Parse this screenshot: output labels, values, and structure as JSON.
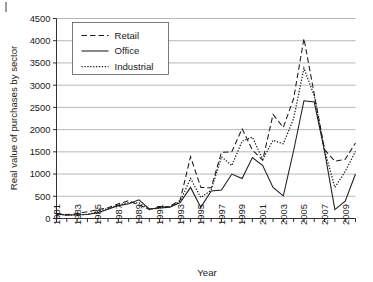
{
  "chart_data": {
    "type": "line",
    "title": "",
    "xlabel": "Year",
    "ylabel": "Real value of purchases by sector",
    "ylim": [
      0,
      4500
    ],
    "xlim": [
      1981,
      2010
    ],
    "grid": true,
    "legend_position": "top-left",
    "yticks": [
      0,
      500,
      1000,
      1500,
      2000,
      2500,
      3000,
      3500,
      4000,
      4500
    ],
    "ytick_labels": [
      "0",
      "500",
      "1000",
      "1500",
      "2000",
      "2500",
      "3000",
      "3500",
      "4000",
      "4500"
    ],
    "x": [
      1981,
      1982,
      1983,
      1984,
      1985,
      1986,
      1987,
      1988,
      1989,
      1990,
      1991,
      1992,
      1993,
      1994,
      1995,
      1996,
      1997,
      1998,
      1999,
      2000,
      2001,
      2002,
      2003,
      2004,
      2005,
      2006,
      2007,
      2008,
      2009,
      2010
    ],
    "xtick_labels": [
      "1981",
      "",
      "1983",
      "",
      "1985",
      "",
      "1987",
      "",
      "1989",
      "",
      "1991",
      "",
      "1993",
      "",
      "1995",
      "",
      "1997",
      "",
      "1999",
      "",
      "2001",
      "",
      "2003",
      "",
      "2005",
      "",
      "2007",
      "",
      "2009",
      ""
    ],
    "series": [
      {
        "name": "Retail",
        "style": "dashed",
        "values": [
          110,
          90,
          110,
          150,
          200,
          240,
          330,
          400,
          300,
          210,
          250,
          270,
          420,
          1390,
          700,
          690,
          1490,
          1500,
          2020,
          1540,
          1310,
          2340,
          2050,
          2700,
          4050,
          2800,
          1550,
          1290,
          1330,
          1700
        ]
      },
      {
        "name": "Office",
        "style": "solid",
        "values": [
          100,
          75,
          85,
          90,
          130,
          210,
          290,
          330,
          420,
          215,
          235,
          255,
          360,
          700,
          250,
          620,
          640,
          1000,
          900,
          1370,
          1190,
          700,
          510,
          1530,
          2650,
          2620,
          1510,
          200,
          390,
          1000
        ]
      },
      {
        "name": "Industrial",
        "style": "dotted",
        "values": [
          95,
          80,
          80,
          95,
          150,
          230,
          300,
          360,
          350,
          200,
          240,
          270,
          390,
          900,
          470,
          640,
          1390,
          1190,
          1740,
          1830,
          1330,
          1760,
          1680,
          2250,
          3380,
          2760,
          1540,
          700,
          1060,
          1510
        ]
      }
    ]
  },
  "legend": {
    "entries": [
      {
        "label": "Retail"
      },
      {
        "label": "Office"
      },
      {
        "label": "Industrial"
      }
    ]
  },
  "axes": {
    "x_title": "Year",
    "y_title": "Real value of purchases by sector"
  }
}
